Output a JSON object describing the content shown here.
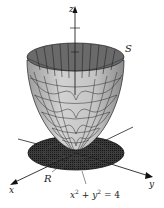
{
  "figure": {
    "surface_label": "S",
    "region_label": "R",
    "axes": {
      "x": "x",
      "y": "y",
      "z": "z"
    },
    "boundary_equation": {
      "lhs_x": "x",
      "lhs_y": "y",
      "exp": "2",
      "plus": " + ",
      "rhs": " = 4"
    },
    "colors": {
      "surface_outer": "#bdbdbd",
      "surface_inner": "#6e6e6e",
      "mesh": "#222222",
      "disk": "#2a2a2a",
      "axis": "#222222",
      "background": "#ffffff"
    }
  }
}
